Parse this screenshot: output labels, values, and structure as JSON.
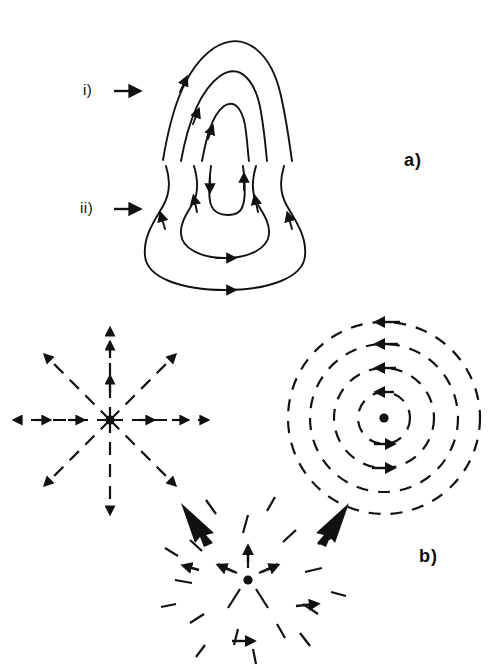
{
  "figure": {
    "type": "scientific-diagram",
    "background_color": "#ffffff",
    "stroke_color": "#111111",
    "width": 494,
    "height": 669,
    "panels": [
      {
        "id": "a",
        "label": "a)",
        "label_position": {
          "x": 404,
          "y": 150
        },
        "rows": [
          {
            "id": "i",
            "label": "i)",
            "label_position": {
              "x": 83,
              "y": 81
            },
            "arrow_marker": "right-arrow",
            "description": "three nested open arch field lines, flow upward",
            "curve_count": 3,
            "flow_direction": "upward",
            "arrowheads": 3
          },
          {
            "id": "ii",
            "label": "ii)",
            "label_position": {
              "x": 80,
              "y": 199
            },
            "arrow_marker": "right-arrow",
            "description": "closed nested loops with central cusp, inflow downward at centre, outflow upward at sides",
            "closed_loop_count": 2,
            "cusp": true,
            "arrowheads": 9
          }
        ]
      },
      {
        "id": "b",
        "label": "b)",
        "label_position": {
          "x": 419,
          "y": 546
        },
        "components": [
          {
            "id": "radial-star",
            "name": "radial-field",
            "center": {
              "x": 110,
              "y": 420
            },
            "ray_count": 8,
            "ray_length": 96,
            "line_style": "dashed",
            "has_center_dot": true,
            "flow_direction": "outward-radial"
          },
          {
            "id": "concentric-circles",
            "name": "azimuthal-field",
            "center": {
              "x": 384,
              "y": 418
            },
            "circle_count": 4,
            "radii": [
              26,
              50,
              74,
              96
            ],
            "line_style": "dashed",
            "has_center_dot": true,
            "flow_direction": "counterclockwise"
          },
          {
            "id": "spiral-result",
            "name": "spiral-field",
            "center": {
              "x": 248,
              "y": 580
            },
            "ring_count": 3,
            "radii": [
              30,
              58,
              84
            ],
            "line_style": "dashed",
            "has_center_dot": true,
            "flow_direction": "outward-spiral"
          }
        ],
        "combine_arrows": [
          {
            "id": "left-combine-arrow",
            "from": {
              "x": 184,
              "y": 505
            },
            "to": {
              "x": 216,
              "y": 534
            },
            "style": "thick-block-arrow"
          },
          {
            "id": "right-combine-arrow",
            "from": {
              "x": 346,
              "y": 505
            },
            "to": {
              "x": 314,
              "y": 534
            },
            "style": "thick-block-arrow"
          }
        ]
      }
    ]
  }
}
